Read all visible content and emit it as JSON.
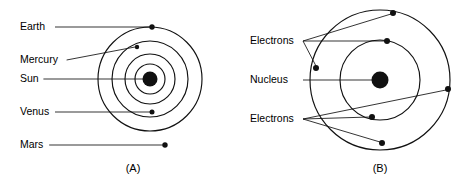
{
  "figure": {
    "width": 466,
    "height": 181,
    "background": "#ffffff",
    "ink_color": "#111111",
    "text_color": "#000000"
  },
  "chart_data": {
    "type": "diagram",
    "title": "",
    "panels": [
      {
        "id": "A",
        "caption": "(A)",
        "subject": "solar-system",
        "center": {
          "x": 150,
          "y": 79,
          "radius": 7.5,
          "label": "Sun"
        },
        "orbits": [
          {
            "name": "Mercury",
            "radius": 15
          },
          {
            "name": "Venus",
            "radius": 25
          },
          {
            "name": "Earth",
            "radius": 38
          },
          {
            "name": "Mars",
            "radius": 52
          }
        ],
        "bodies": [
          {
            "name": "Earth",
            "x": 152,
            "y": 27,
            "r": 2.7,
            "orbit": 3
          },
          {
            "name": "Mercury",
            "x": 137,
            "y": 47,
            "r": 2.2,
            "orbit": 0
          },
          {
            "name": "Venus",
            "x": 152,
            "y": 112,
            "r": 2.5,
            "orbit": 1
          },
          {
            "name": "Mars",
            "x": 165,
            "y": 145,
            "r": 2.7,
            "orbit": 3
          }
        ],
        "labels": [
          {
            "text": "Earth",
            "x": 20,
            "y": 27,
            "leader_to_x": 150,
            "leader_to_y": 27
          },
          {
            "text": "Mercury",
            "x": 20,
            "y": 60,
            "leader_to_x": 135,
            "leader_to_y": 47
          },
          {
            "text": "Sun",
            "x": 20,
            "y": 79,
            "leader_to_x": 144,
            "leader_to_y": 79
          },
          {
            "text": "Venus",
            "x": 20,
            "y": 112,
            "leader_to_x": 150,
            "leader_to_y": 112
          },
          {
            "text": "Mars",
            "x": 20,
            "y": 145,
            "leader_to_x": 163,
            "leader_to_y": 145
          }
        ]
      },
      {
        "id": "B",
        "caption": "(B)",
        "subject": "atom",
        "center": {
          "x": 380,
          "y": 80,
          "radius": 8.5,
          "label": "Nucleus"
        },
        "orbits": [
          {
            "name": "inner-shell",
            "radius": 40
          },
          {
            "name": "outer-shell",
            "radius": 70
          }
        ],
        "bodies": [
          {
            "name": "Electron",
            "x": 393,
            "y": 13,
            "r": 3.0,
            "orbit": 1
          },
          {
            "name": "Electron",
            "x": 387,
            "y": 41,
            "r": 3.0,
            "orbit": 0
          },
          {
            "name": "Electron",
            "x": 316,
            "y": 68,
            "r": 3.0,
            "orbit": 1
          },
          {
            "name": "Electron",
            "x": 448,
            "y": 89,
            "r": 3.0,
            "orbit": 1
          },
          {
            "name": "Electron",
            "x": 372,
            "y": 117,
            "r": 3.0,
            "orbit": 0
          },
          {
            "name": "Electron",
            "x": 382,
            "y": 143,
            "r": 3.0,
            "orbit": 1
          }
        ],
        "labels": [
          {
            "text": "Electrons",
            "x": 250,
            "y": 41,
            "anchor_x": 303,
            "anchor_y": 41,
            "targets": [
              {
                "x": 391,
                "y": 14
              },
              {
                "x": 385,
                "y": 41
              },
              {
                "x": 316,
                "y": 66
              }
            ]
          },
          {
            "text": "Nucleus",
            "x": 250,
            "y": 80,
            "anchor_x": 303,
            "anchor_y": 80,
            "targets": [
              {
                "x": 372,
                "y": 80
              }
            ]
          },
          {
            "text": "Electrons",
            "x": 250,
            "y": 119,
            "anchor_x": 303,
            "anchor_y": 119,
            "targets": [
              {
                "x": 446,
                "y": 90
              },
              {
                "x": 370,
                "y": 117
              },
              {
                "x": 380,
                "y": 142
              }
            ]
          }
        ]
      }
    ]
  },
  "captions": {
    "panel_a": "(A)",
    "panel_b": "(B)"
  },
  "panel_a_labels": {
    "earth": "Earth",
    "mercury": "Mercury",
    "sun": "Sun",
    "venus": "Venus",
    "mars": "Mars"
  },
  "panel_b_labels": {
    "electrons_top": "Electrons",
    "nucleus": "Nucleus",
    "electrons_bottom": "Electrons"
  }
}
